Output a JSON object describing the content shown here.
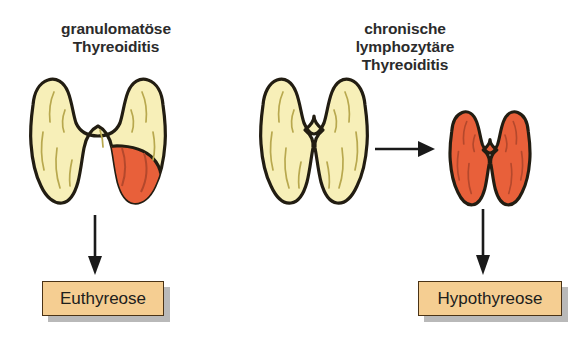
{
  "figure": {
    "columns": [
      {
        "heading": "granulomatöse\nThyreoiditis",
        "gland_name": "granulomatous-thyroid-gland",
        "outcome": "Euthyreose"
      },
      {
        "heading": "chronische\nlymphozytäre\nThyreoiditis",
        "gland_name": "normal-thyroid-gland",
        "gland_result_name": "atrophic-thyroid-gland",
        "outcome": "Hypothyreose"
      }
    ],
    "colors": {
      "gland_normal_fill": "#f7efb8",
      "gland_inflamed_fill": "#e8603a",
      "gland_outline": "#221d12",
      "gland_detail_line": "#b8a84e",
      "outcome_box_fill": "#f5ce92",
      "outcome_box_border": "#4a3316",
      "outcome_box_shadow": "#808080",
      "arrow": "#1a1a1a",
      "heading_text": "#2b2b2b",
      "background": "#ffffff"
    },
    "icons": {
      "arrow_right": "arrow-right-icon",
      "arrow_down": "arrow-down-icon"
    }
  }
}
